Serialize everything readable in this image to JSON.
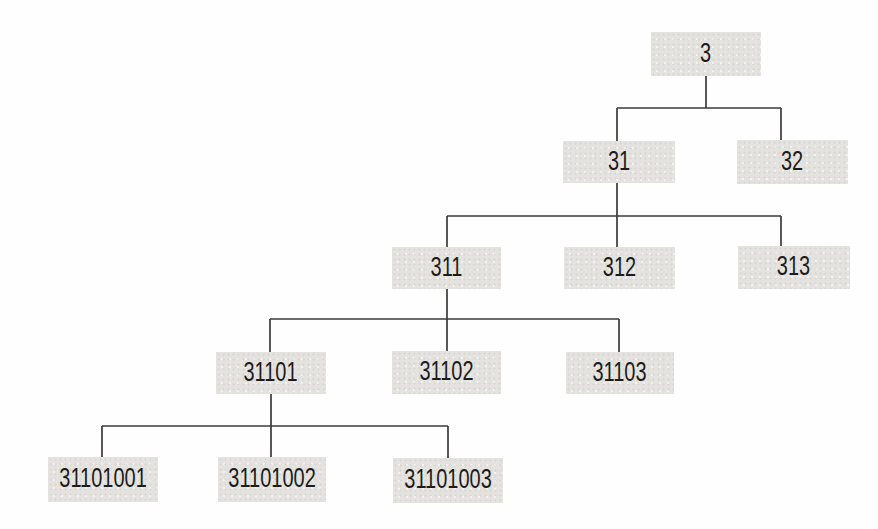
{
  "diagram": {
    "type": "tree",
    "colors": {
      "box_fill": "#e4e3e0",
      "box_border": "#3a3937",
      "connector_line": "#3c3b39",
      "text": "#1d1c1a",
      "background": "#fefefe"
    },
    "nodes": [
      {
        "id": "3",
        "label": "3",
        "level": 1,
        "parent": null
      },
      {
        "id": "31",
        "label": "31",
        "level": 2,
        "parent": "3"
      },
      {
        "id": "32",
        "label": "32",
        "level": 2,
        "parent": "3"
      },
      {
        "id": "311",
        "label": "311",
        "level": 3,
        "parent": "31"
      },
      {
        "id": "312",
        "label": "312",
        "level": 3,
        "parent": "31"
      },
      {
        "id": "313",
        "label": "313",
        "level": 3,
        "parent": "31"
      },
      {
        "id": "31101",
        "label": "31101",
        "level": 4,
        "parent": "311"
      },
      {
        "id": "31102",
        "label": "31102",
        "level": 4,
        "parent": "311"
      },
      {
        "id": "31103",
        "label": "31103",
        "level": 4,
        "parent": "311"
      },
      {
        "id": "31101001",
        "label": "31101001",
        "level": 5,
        "parent": "31101"
      },
      {
        "id": "31101002",
        "label": "31101002",
        "level": 5,
        "parent": "31101"
      },
      {
        "id": "31101003",
        "label": "31101003",
        "level": 5,
        "parent": "31101"
      }
    ]
  }
}
